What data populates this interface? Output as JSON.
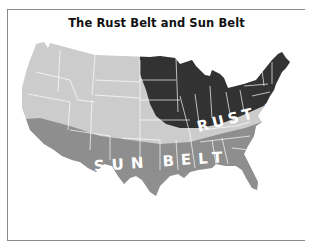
{
  "title": "The Rust Belt and Sun Belt",
  "regions": [
    {
      "name": "Rust Belt",
      "label": "RUST BELT",
      "color": "#333333"
    },
    {
      "name": "Sun Belt",
      "label": "SUN BELT",
      "color": "#8f8f8f"
    },
    {
      "name": "Other",
      "label": "",
      "color": "#cccccc"
    }
  ],
  "labels": {
    "rust_belt": "RUST BELT",
    "sun_belt": "SUN BELT"
  },
  "colors": {
    "state_border": "#ffffff",
    "frame": "#8a8a8a",
    "background": "#ffffff"
  }
}
